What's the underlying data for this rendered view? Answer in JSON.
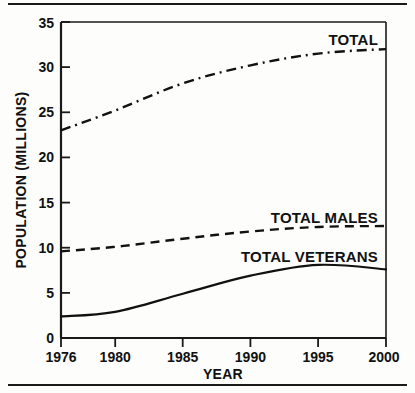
{
  "chart_data": {
    "type": "line",
    "title": "",
    "xlabel": "YEAR",
    "ylabel": "POPULATION (MILLIONS)",
    "xlim": [
      1976,
      2000
    ],
    "ylim": [
      0,
      35
    ],
    "grid": false,
    "legend_position": "inline-right",
    "x_ticks": [
      "1976",
      "1980",
      "1985",
      "1990",
      "1995",
      "2000"
    ],
    "x_tick_values": [
      1976,
      1980,
      1985,
      1990,
      1995,
      2000
    ],
    "y_ticks": [
      "0",
      "5",
      "10",
      "15",
      "20",
      "25",
      "30",
      "35"
    ],
    "y_tick_values": [
      0,
      5,
      10,
      15,
      20,
      25,
      30,
      35
    ],
    "x": [
      1976,
      1980,
      1985,
      1990,
      1995,
      2000
    ],
    "series": [
      {
        "name": "TOTAL",
        "style": "dash-dot",
        "color": "#111111",
        "values": [
          23.0,
          25.2,
          28.2,
          30.2,
          31.5,
          32.0
        ],
        "label_text": "TOTAL"
      },
      {
        "name": "TOTAL MALES",
        "style": "dashed",
        "color": "#111111",
        "values": [
          9.6,
          10.1,
          11.0,
          11.8,
          12.3,
          12.4
        ],
        "label_text": "TOTAL MALES"
      },
      {
        "name": "TOTAL VETERANS",
        "style": "solid",
        "color": "#111111",
        "values": [
          2.4,
          2.9,
          4.9,
          6.9,
          8.1,
          7.6
        ],
        "label_text": "TOTAL VETERANS"
      }
    ]
  },
  "axis": {
    "y_tick_0": "0",
    "y_tick_5": "5",
    "y_tick_10": "10",
    "y_tick_15": "15",
    "y_tick_20": "20",
    "y_tick_25": "25",
    "y_tick_30": "30",
    "y_tick_35": "35",
    "x_tick_1976": "1976",
    "x_tick_1980": "1980",
    "x_tick_1985": "1985",
    "x_tick_1990": "1990",
    "x_tick_1995": "1995",
    "x_tick_2000": "2000",
    "x_title": "YEAR",
    "y_title": "POPULATION (MILLIONS)"
  },
  "labels": {
    "total": "TOTAL",
    "total_males": "TOTAL MALES",
    "total_veterans": "TOTAL VETERANS"
  }
}
